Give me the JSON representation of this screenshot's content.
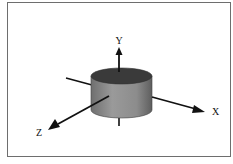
{
  "diagram": {
    "type": "3d-coordinate-axes-with-cylinder",
    "axes": [
      {
        "name": "x",
        "label": "X"
      },
      {
        "name": "y",
        "label": "Y"
      },
      {
        "name": "z",
        "label": "Z"
      }
    ],
    "object": "cylinder",
    "colors": {
      "frame": "#6e6e6e",
      "axis": "#111111",
      "cylinder_side": "#8a8a8a",
      "cylinder_top": "#3a3a3a"
    }
  }
}
